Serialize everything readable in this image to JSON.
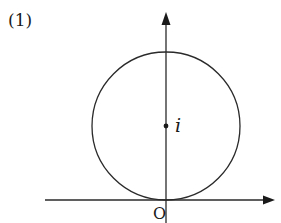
{
  "figure": {
    "number_label": "(1)",
    "center_label": "i",
    "origin_label": "O"
  },
  "geometry": {
    "circle": {
      "cx": 166,
      "cy": 126,
      "r": 74
    },
    "x_axis": {
      "y": 200,
      "x1": 45,
      "x2": 274
    },
    "y_axis": {
      "x": 166,
      "y1": 223,
      "y2": 12
    },
    "stroke_color": "#2a2a2a"
  }
}
